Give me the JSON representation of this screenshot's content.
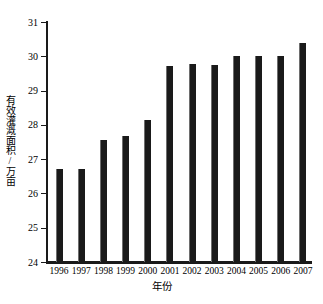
{
  "chart_data": {
    "type": "bar",
    "title": "",
    "xlabel": "年份",
    "ylabel": "有效灌溉面积/万亩",
    "categories": [
      "1996",
      "1997",
      "1998",
      "1999",
      "2000",
      "2001",
      "2002",
      "2003",
      "2004",
      "2005",
      "2006",
      "2007"
    ],
    "values": [
      26.7,
      26.7,
      27.55,
      27.68,
      28.15,
      29.73,
      29.78,
      29.75,
      30.02,
      30.02,
      30.0,
      30.4
    ],
    "series": [
      {
        "name": "有效灌溉面积",
        "values": [
          26.7,
          26.7,
          27.55,
          27.68,
          28.15,
          29.73,
          29.78,
          29.75,
          30.02,
          30.02,
          30.0,
          30.4
        ]
      }
    ],
    "ylim": [
      24,
      31
    ],
    "yticks": [
      24,
      25,
      26,
      27,
      28,
      29,
      30,
      31
    ],
    "ytick_labels": [
      "24",
      "25",
      "26",
      "27",
      "28",
      "29",
      "30",
      "31"
    ],
    "grid": false,
    "legend": false,
    "legend_position": "none",
    "bar_color": "#1a1a1a",
    "axis_color": "#1a1a1a",
    "background_color": "#ffffff"
  }
}
